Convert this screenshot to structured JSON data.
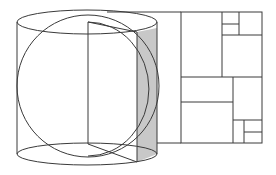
{
  "figure": {
    "description": "Line drawing of a cylinder with an inscribed circle and a half-disc cross-section plane, next to a recursively subdivided rectangle (squares/rectangles tiling)",
    "colors": {
      "stroke": "#3a3a3a",
      "shade": "#c8c8c8",
      "background": "#ffffff"
    },
    "cylinder": {
      "left_x": 17,
      "right_x": 157,
      "top_ellipse": {
        "cx": 87,
        "cy": 22,
        "rx": 70,
        "ry": 12
      },
      "bottom_ellipse": {
        "cx": 87,
        "cy": 154,
        "rx": 70,
        "ry": 11
      }
    },
    "circle": {
      "cx": 88,
      "cy": 86,
      "r": 71
    },
    "plane": {
      "spine_x": 88,
      "top_y": 22,
      "bottom_y": 144
    },
    "tiling": {
      "outer": {
        "x": 181,
        "y": 12,
        "w": 81,
        "h": 131
      },
      "lines": [
        {
          "x1": 222,
          "y1": 12,
          "x2": 222,
          "y2": 77
        },
        {
          "x1": 239,
          "y1": 12,
          "x2": 239,
          "y2": 35
        },
        {
          "x1": 222,
          "y1": 24,
          "x2": 239,
          "y2": 24
        },
        {
          "x1": 222,
          "y1": 35,
          "x2": 262,
          "y2": 35
        },
        {
          "x1": 181,
          "y1": 77,
          "x2": 262,
          "y2": 77
        },
        {
          "x1": 233,
          "y1": 77,
          "x2": 233,
          "y2": 143
        },
        {
          "x1": 181,
          "y1": 102,
          "x2": 233,
          "y2": 102
        },
        {
          "x1": 233,
          "y1": 120,
          "x2": 262,
          "y2": 120
        },
        {
          "x1": 244,
          "y1": 120,
          "x2": 244,
          "y2": 143
        },
        {
          "x1": 244,
          "y1": 132,
          "x2": 262,
          "y2": 132
        }
      ]
    }
  }
}
